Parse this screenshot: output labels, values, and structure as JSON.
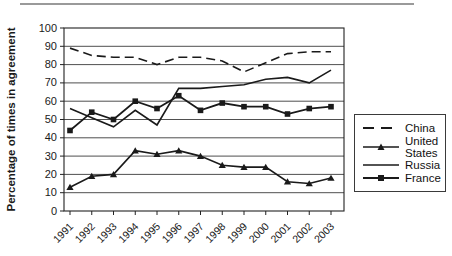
{
  "page": {
    "divider": "top-horizontal-rule"
  },
  "chart_data": {
    "type": "line",
    "title": "",
    "xlabel": "",
    "ylabel": "Percentage of times in agreement",
    "ylim": [
      0,
      100
    ],
    "ytick_step": 10,
    "grid": "horizontal",
    "legend_position": "right-outside-box",
    "line_color": "#1a1a1a",
    "categories": [
      "1991",
      "1992",
      "1993",
      "1994",
      "1995",
      "1996",
      "1997",
      "1998",
      "1999",
      "2000",
      "2001",
      "2002",
      "2003"
    ],
    "series": [
      {
        "name": "China",
        "style": "dashed",
        "marker": "none",
        "values": [
          89,
          85,
          84,
          84,
          80,
          84,
          84,
          82,
          76,
          81,
          86,
          87,
          87
        ]
      },
      {
        "name": "United States",
        "style": "solid",
        "marker": "triangle",
        "values": [
          13,
          19,
          20,
          33,
          31,
          33,
          30,
          25,
          24,
          24,
          16,
          15,
          18
        ]
      },
      {
        "name": "Russia",
        "style": "solid",
        "marker": "none",
        "values": [
          56,
          51,
          46,
          55,
          47,
          67,
          67,
          68,
          69,
          72,
          73,
          70,
          77
        ]
      },
      {
        "name": "France",
        "style": "solid",
        "marker": "square",
        "values": [
          44,
          54,
          50,
          60,
          56,
          63,
          55,
          59,
          57,
          57,
          53,
          56,
          57
        ]
      }
    ]
  }
}
